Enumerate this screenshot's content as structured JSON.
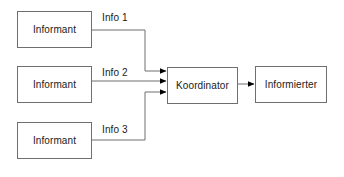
{
  "diagram": {
    "background_color": "#ffffff",
    "line_color": "#6f6f6f",
    "arrow_color": "#000000",
    "text_color": "#1a1a1a",
    "nodes": [
      {
        "id": "informant-1",
        "label": "Informant"
      },
      {
        "id": "informant-2",
        "label": "Informant"
      },
      {
        "id": "informant-3",
        "label": "Informant"
      },
      {
        "id": "koordinator",
        "label": "Koordinator"
      },
      {
        "id": "informierter",
        "label": "Informierter"
      }
    ],
    "edges": [
      {
        "id": "edge-1",
        "from": "informant-1",
        "to": "koordinator",
        "label": "Info 1"
      },
      {
        "id": "edge-2",
        "from": "informant-2",
        "to": "koordinator",
        "label": "Info 2"
      },
      {
        "id": "edge-3",
        "from": "informant-3",
        "to": "koordinator",
        "label": "Info 3"
      },
      {
        "id": "edge-4",
        "from": "koordinator",
        "to": "informierter",
        "label": ""
      }
    ]
  }
}
